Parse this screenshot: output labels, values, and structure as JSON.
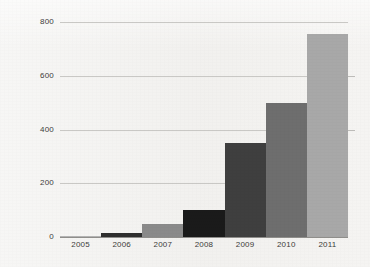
{
  "chart_data": {
    "type": "bar",
    "title": "",
    "subtitle": "",
    "xlabel": "",
    "ylabel": "",
    "categories": [
      "2005",
      "2006",
      "2007",
      "2008",
      "2009",
      "2010",
      "2011"
    ],
    "values": [
      5,
      15,
      50,
      100,
      350,
      500,
      755
    ],
    "bar_colors": [
      "#b5b5b5",
      "#2e2e2e",
      "#8a8a8a",
      "#1a1a1a",
      "#3f3f3f",
      "#6e6e6e",
      "#a8a8a8"
    ],
    "ylim": [
      0,
      800
    ],
    "ytick_labels": [
      "0",
      "200",
      "400",
      "600",
      "800"
    ],
    "ytick_values": [
      0,
      200,
      400,
      600,
      800
    ],
    "grid": "horizontal",
    "legend": "none",
    "bar_gap": 0,
    "background_color": "#f2f1ef",
    "gridline_color": "#c9c8c5",
    "axis_color": "#8f8e8b",
    "tick_label_color": "#3d3c3a"
  }
}
